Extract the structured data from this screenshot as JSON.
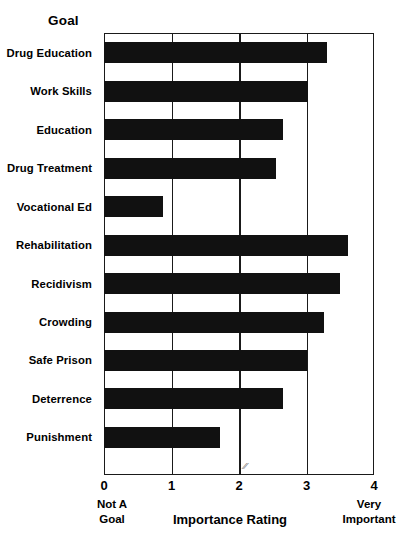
{
  "chart_data": {
    "type": "bar",
    "orientation": "horizontal",
    "title": "",
    "xlabel": "Importance Rating",
    "ylabel": "Goal",
    "xlim": [
      0,
      4
    ],
    "ylim": null,
    "grid": true,
    "legend": null,
    "xticks": [
      "0",
      "1",
      "2",
      "3",
      "4"
    ],
    "xtick_values": [
      0,
      1,
      2,
      3,
      4
    ],
    "bar_color": "#111111",
    "axis_color": "#1a1a1a",
    "background_color": "#ffffff",
    "annotations": {
      "x_axis_left_caption_line1": "Not A",
      "x_axis_left_caption_line2": "Goal",
      "x_axis_right_caption_line1": "Very",
      "x_axis_right_caption_line2": "Important"
    },
    "categories": [
      "Drug Education",
      "Work Skills",
      "Education",
      "Drug Treatment",
      "Vocational Ed",
      "Rehabilitation",
      "Recidivism",
      "Crowding",
      "Safe Prison",
      "Deterrence",
      "Punishment"
    ],
    "values": [
      3.31,
      3.02,
      2.65,
      2.55,
      0.87,
      3.61,
      3.49,
      3.26,
      3.0,
      2.65,
      1.72
    ]
  }
}
